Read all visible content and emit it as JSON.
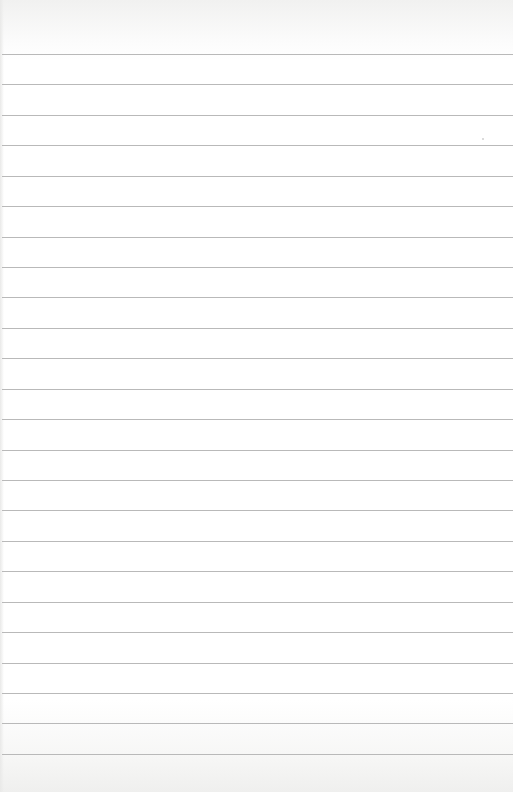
{
  "sheet": {
    "type": "lined-paper",
    "rule_color": "#b9b9b9",
    "paper_color": "#ffffff",
    "rule_count": 24,
    "first_rule_y": 54,
    "rule_spacing": 30.43
  }
}
